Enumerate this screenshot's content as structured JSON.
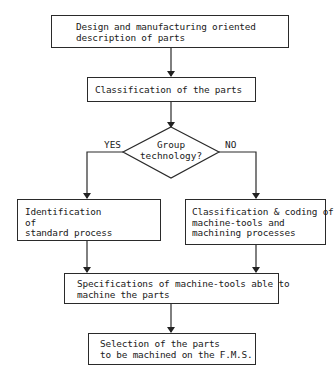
{
  "flowchart": {
    "step1": {
      "lines": [
        "Design and manufacturing oriented",
        "description of parts"
      ]
    },
    "step2": {
      "lines": [
        "Classification of the parts"
      ]
    },
    "decision": {
      "lines": [
        "Group",
        "technology?"
      ],
      "yes_label": "YES",
      "no_label": "NO"
    },
    "yes_branch": {
      "lines": [
        "Identification",
        "of",
        "standard process"
      ]
    },
    "no_branch": {
      "lines": [
        "Classification & coding of",
        "machine-tools and",
        "machining processes"
      ]
    },
    "step5": {
      "lines": [
        "Specifications of machine-tools able to",
        "machine the parts"
      ]
    },
    "step6": {
      "lines": [
        "Selection of the parts",
        "to be machined on the F.M.S."
      ]
    }
  }
}
